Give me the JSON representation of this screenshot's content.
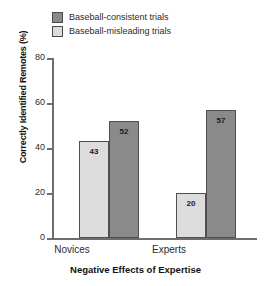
{
  "chart_data": {
    "type": "bar",
    "title": "",
    "xlabel": "Negative Effects of Expertise",
    "ylabel": "Correctly Identified Remotes (%)",
    "categories": [
      "Novices",
      "Experts"
    ],
    "series": [
      {
        "name": "Baseball-consistent trials",
        "values": [
          52,
          57
        ],
        "color": "#8a8a8a"
      },
      {
        "name": "Baseball-misleading trials",
        "values": [
          43,
          20
        ],
        "color": "#dcdcdc"
      }
    ],
    "series_order_in_plot": [
      "Baseball-misleading trials",
      "Baseball-consistent trials"
    ],
    "ylim": [
      0,
      80
    ],
    "yticks": [
      0,
      20,
      40,
      60,
      80
    ],
    "ytick_labels": [
      "0",
      "20",
      "40",
      "60",
      "80"
    ],
    "grid": false,
    "legend_position": "top-center",
    "data_labels": [
      "43",
      "52",
      "20",
      "57"
    ],
    "background_color": "#ffffff",
    "axis_color": "#6e6e6e",
    "bar_border_color": "#4f4f4f"
  },
  "legend": {
    "items": [
      {
        "label": "Baseball-consistent trials",
        "swatch": "dark"
      },
      {
        "label": "Baseball-misleading trials",
        "swatch": "light"
      }
    ]
  },
  "axes": {
    "y_title": "Correctly Identified Remotes (%)",
    "x_title": "Negative Effects of Expertise",
    "y_ticks": [
      "80",
      "60",
      "40",
      "20",
      "0"
    ],
    "x_categories": [
      "Novices",
      "Experts"
    ]
  },
  "bars": [
    {
      "group": "Novices",
      "series": "Baseball-misleading trials",
      "value": 43,
      "label": "43",
      "tone": "light"
    },
    {
      "group": "Novices",
      "series": "Baseball-consistent trials",
      "value": 52,
      "label": "52",
      "tone": "dark"
    },
    {
      "group": "Experts",
      "series": "Baseball-misleading trials",
      "value": 20,
      "label": "20",
      "tone": "light"
    },
    {
      "group": "Experts",
      "series": "Baseball-consistent trials",
      "value": 57,
      "label": "57",
      "tone": "dark"
    }
  ]
}
